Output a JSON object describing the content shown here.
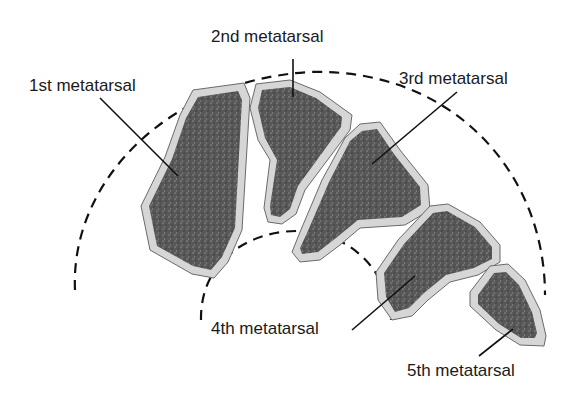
{
  "diagram": {
    "colors": {
      "bone_fill": "#555555",
      "cortex": "#d4d4d4",
      "outline": "#6a6a6a",
      "dashed_arc": "#111111",
      "leader_line": "#111111",
      "text": "#1a1a1a"
    },
    "labels": [
      {
        "id": "first",
        "text": "1st metatarsal"
      },
      {
        "id": "second",
        "text": "2nd metatarsal"
      },
      {
        "id": "third",
        "text": "3rd metatarsal"
      },
      {
        "id": "fourth",
        "text": "4th metatarsal"
      },
      {
        "id": "fifth",
        "text": "5th metatarsal"
      }
    ]
  }
}
